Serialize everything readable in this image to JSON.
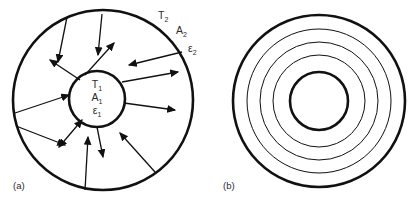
{
  "figure": {
    "background_color": "#ffffff",
    "stroke_color": "#111111",
    "text_color": "#2b2b2b"
  },
  "panels": [
    {
      "id": "a",
      "label": "(a)",
      "outer_circle": {
        "cx": 103,
        "cy": 100,
        "r": 90,
        "stroke_width": 2.6
      },
      "inner_circle": {
        "cx": 97,
        "cy": 99,
        "r": 28,
        "stroke_width": 2.6
      },
      "inner_labels": [
        {
          "base": "T",
          "subscript": "1",
          "x": 97,
          "y": 88
        },
        {
          "base": "A",
          "subscript": "1",
          "x": 97,
          "y": 101
        },
        {
          "base": "ε",
          "subscript": "1",
          "x": 97,
          "y": 114
        }
      ],
      "outer_labels": [
        {
          "base": "T",
          "subscript": "2",
          "x": 158,
          "y": 19
        },
        {
          "base": "A",
          "subscript": "2",
          "x": 176,
          "y": 34
        },
        {
          "base": "ε",
          "subscript": "2",
          "x": 188,
          "y": 52
        }
      ],
      "arrows": [
        {
          "name": "inward-top-left",
          "x1": 67,
          "y1": 17,
          "x2": 58,
          "y2": 62,
          "head": "end"
        },
        {
          "name": "inward-top-center",
          "x1": 102,
          "y1": 14,
          "x2": 98,
          "y2": 55,
          "head": "end"
        },
        {
          "name": "outward-up-right",
          "x1": 85,
          "y1": 75,
          "x2": 114,
          "y2": 43,
          "head": "end"
        },
        {
          "name": "outward-up-left",
          "x1": 80,
          "y1": 80,
          "x2": 50,
          "y2": 60,
          "head": "end"
        },
        {
          "name": "inward-right-upper",
          "x1": 182,
          "y1": 52,
          "x2": 129,
          "y2": 65,
          "head": "end"
        },
        {
          "name": "outward-right-upper",
          "x1": 122,
          "y1": 82,
          "x2": 178,
          "y2": 72,
          "head": "end"
        },
        {
          "name": "outward-right-lower",
          "x1": 124,
          "y1": 103,
          "x2": 175,
          "y2": 110,
          "head": "end"
        },
        {
          "name": "inward-left",
          "x1": 15,
          "y1": 113,
          "x2": 69,
          "y2": 95,
          "head": "end"
        },
        {
          "name": "double-lower-left",
          "x1": 16,
          "y1": 126,
          "x2": 65,
          "y2": 145,
          "head": "end"
        },
        {
          "name": "outward-lower-left",
          "x1": 82,
          "y1": 120,
          "x2": 59,
          "y2": 147,
          "head": "both"
        },
        {
          "name": "outward-down",
          "x1": 97,
          "y1": 127,
          "x2": 103,
          "y2": 157,
          "head": "end"
        },
        {
          "name": "inward-bottom",
          "x1": 85,
          "y1": 190,
          "x2": 88,
          "y2": 137,
          "head": "end"
        },
        {
          "name": "inward-lower-right",
          "x1": 155,
          "y1": 172,
          "x2": 120,
          "y2": 133,
          "head": "end"
        }
      ]
    },
    {
      "id": "b",
      "label": "(b)",
      "center": {
        "cx": 319,
        "cy": 101
      },
      "circles": [
        {
          "name": "shield-outer",
          "r": 86,
          "stroke_width": 2.6
        },
        {
          "name": "shield-4",
          "r": 72,
          "stroke_width": 1.0
        },
        {
          "name": "shield-3",
          "r": 59,
          "stroke_width": 1.0
        },
        {
          "name": "shield-2",
          "r": 46,
          "stroke_width": 1.0
        },
        {
          "name": "shield-inner",
          "r": 29,
          "stroke_width": 2.6
        }
      ]
    }
  ]
}
